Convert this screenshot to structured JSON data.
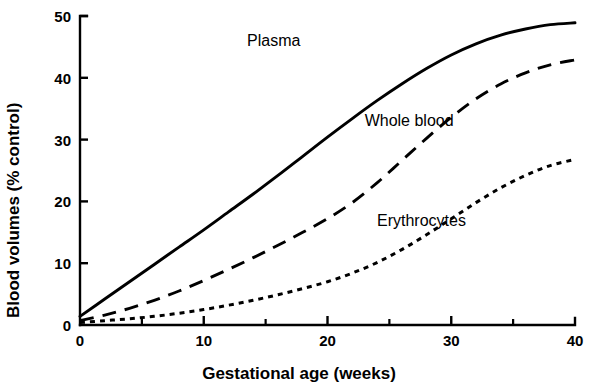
{
  "chart_data": {
    "type": "line",
    "title": "",
    "xlabel": "Gestational age (weeks)",
    "ylabel": "Blood volumes (% control)",
    "xlim": [
      0,
      40
    ],
    "ylim": [
      0,
      50
    ],
    "xticks": [
      0,
      10,
      20,
      30,
      40
    ],
    "xtick_labels": [
      "0",
      "10",
      "20",
      "30",
      "40"
    ],
    "xminor_ticks": [
      5,
      15,
      25,
      35
    ],
    "yticks": [
      0,
      10,
      20,
      30,
      40,
      50
    ],
    "ytick_labels": [
      "0",
      "10",
      "20",
      "30",
      "40",
      "50"
    ],
    "grid": false,
    "legend": "inline-annotations",
    "line_color": "#000000",
    "x": [
      0,
      2,
      4,
      6,
      8,
      10,
      12,
      14,
      16,
      18,
      20,
      22,
      24,
      26,
      28,
      30,
      32,
      34,
      36,
      38,
      40
    ],
    "series": [
      {
        "name": "Plasma",
        "style": "solid",
        "label_position": {
          "x": 13.5,
          "y": 45.8
        },
        "values": [
          1.4,
          4.2,
          7.0,
          9.8,
          12.6,
          15.4,
          18.3,
          21.2,
          24.2,
          27.3,
          30.4,
          33.4,
          36.3,
          39.0,
          41.5,
          43.7,
          45.5,
          46.9,
          47.9,
          48.6,
          48.9
        ]
      },
      {
        "name": "Whole blood",
        "style": "dashed",
        "label_position": {
          "x": 23.0,
          "y": 32.8
        },
        "values": [
          0.7,
          1.6,
          2.7,
          4.0,
          5.5,
          7.2,
          9.0,
          10.9,
          12.9,
          15.0,
          17.2,
          19.8,
          23.0,
          26.6,
          30.2,
          33.6,
          36.6,
          39.0,
          40.8,
          42.1,
          42.9
        ]
      },
      {
        "name": "Erythrocytes",
        "style": "dotted",
        "label_position": {
          "x": 24.0,
          "y": 16.6
        },
        "values": [
          0.4,
          0.7,
          1.0,
          1.4,
          1.9,
          2.5,
          3.2,
          4.0,
          4.9,
          5.9,
          7.0,
          8.4,
          10.1,
          12.2,
          14.6,
          17.2,
          19.8,
          22.2,
          24.2,
          25.8,
          26.8
        ]
      }
    ]
  }
}
